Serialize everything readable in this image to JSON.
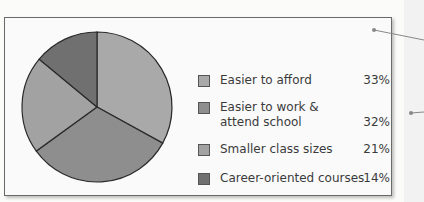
{
  "chart_data": {
    "type": "pie",
    "title": "",
    "categories": [
      "Easier to afford",
      "Easier to work & attend school",
      "Smaller class sizes",
      "Career-oriented courses"
    ],
    "values": [
      33,
      32,
      21,
      14
    ],
    "unit": "%",
    "colors": [
      "#a9a9a9",
      "#8e8e8e",
      "#a2a2a2",
      "#707070"
    ],
    "legend_position": "right",
    "start_angle": "12 o'clock, clockwise"
  },
  "legend": {
    "items": [
      {
        "label_line1": "Easier to afford",
        "label_line2": "",
        "value": "33%",
        "color": "#a9a9a9"
      },
      {
        "label_line1": "Easier to work &",
        "label_line2": "attend school",
        "value": "32%",
        "color": "#8e8e8e"
      },
      {
        "label_line1": "Smaller class sizes",
        "label_line2": "",
        "value": "21%",
        "color": "#a2a2a2"
      },
      {
        "label_line1": "Career-oriented courses",
        "label_line2": "",
        "value": "14%",
        "color": "#707070"
      }
    ]
  }
}
